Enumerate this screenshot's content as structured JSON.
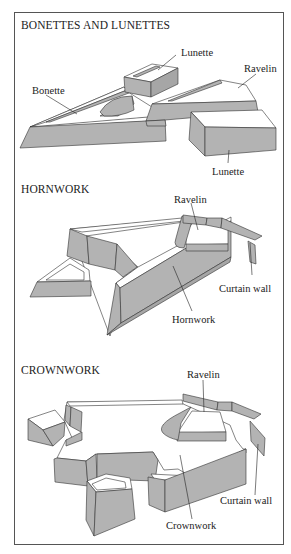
{
  "figure": {
    "sections": [
      {
        "id": "bonettes-lunettes",
        "heading": "BONETTES AND LUNETTES",
        "labels": {
          "lunette_top": "Lunette",
          "ravelin": "Ravelin",
          "bonette": "Bonette",
          "lunette_bottom": "Lunette"
        }
      },
      {
        "id": "hornwork",
        "heading": "HORNWORK",
        "labels": {
          "ravelin": "Ravelin",
          "curtain_wall": "Curtain wall",
          "hornwork": "Hornwork"
        }
      },
      {
        "id": "crownwork",
        "heading": "CROWNWORK",
        "labels": {
          "ravelin": "Ravelin",
          "curtain_wall": "Curtain wall",
          "crownwork": "Crownwork"
        }
      }
    ],
    "colors": {
      "wall_fill": "#b3b3b3",
      "outline": "#333333",
      "frame": "#555555",
      "background": "#ffffff"
    }
  }
}
